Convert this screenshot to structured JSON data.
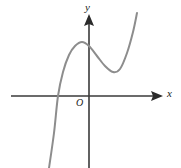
{
  "figure": {
    "kind": "coordinate-plane-graph",
    "background_color": "#ffffff",
    "width": 181,
    "height": 168
  },
  "axes": {
    "x_label": "x",
    "y_label": "y",
    "origin_label": "O",
    "color": "#3a3a3a",
    "arrowhead_color": "#2b2b2b",
    "origin_px": {
      "x": 89,
      "y": 96
    },
    "x_axis_px": {
      "x_start": 11,
      "x_end": 163,
      "y": 96
    },
    "y_axis_px": {
      "y_start": 15,
      "y_end": 168,
      "x": 89
    }
  },
  "chart_data": {
    "type": "line",
    "title": "",
    "subtitle": "",
    "xlabel": "x",
    "ylabel": "y",
    "grid": false,
    "legend": null,
    "annotations": [
      "O"
    ],
    "series": [
      {
        "name": "cubic curve",
        "color": "#8d8d8d",
        "shape": "cubic with local maximum left of y-axis and local minimum right of y-axis",
        "points_px": [
          {
            "x": 49,
            "y": 168
          },
          {
            "x": 54,
            "y": 133
          },
          {
            "x": 58,
            "y": 96
          },
          {
            "x": 63,
            "y": 72
          },
          {
            "x": 69,
            "y": 55
          },
          {
            "x": 75,
            "y": 46
          },
          {
            "x": 82,
            "y": 42
          },
          {
            "x": 89,
            "y": 46
          },
          {
            "x": 97,
            "y": 56
          },
          {
            "x": 105,
            "y": 66
          },
          {
            "x": 113,
            "y": 72
          },
          {
            "x": 120,
            "y": 69
          },
          {
            "x": 127,
            "y": 53
          },
          {
            "x": 133,
            "y": 32
          },
          {
            "x": 137,
            "y": 13
          }
        ],
        "features": {
          "local_maximum_px": {
            "x": 82,
            "y": 42
          },
          "local_minimum_px": {
            "x": 113,
            "y": 72
          },
          "x_intercepts_px": [
            {
              "x": 58,
              "y": 96
            }
          ],
          "y_intercept_px": {
            "x": 89,
            "y": 46
          }
        }
      }
    ]
  }
}
